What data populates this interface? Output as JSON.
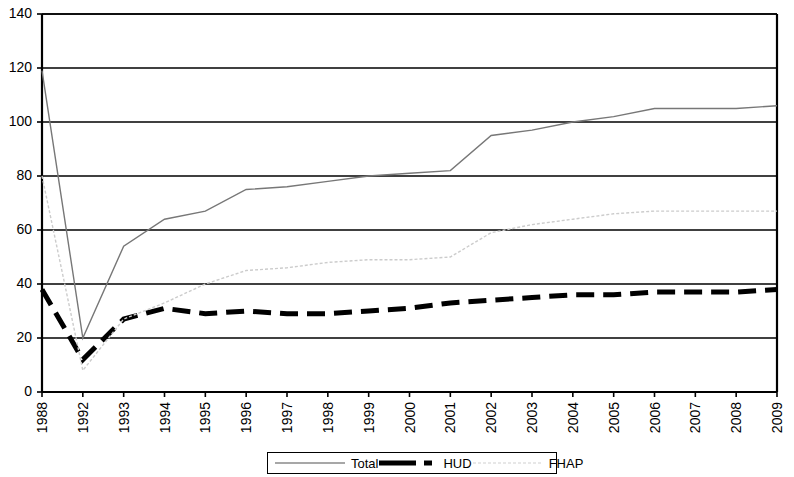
{
  "chart_data": {
    "type": "line",
    "title": "",
    "xlabel": "",
    "ylabel": "",
    "ylim": [
      0,
      140
    ],
    "ytick_step": 20,
    "grid": true,
    "legend_position": "bottom",
    "categories": [
      "1988",
      "1992",
      "1993",
      "1994",
      "1995",
      "1996",
      "1997",
      "1998",
      "1999",
      "2000",
      "2001",
      "2002",
      "2003",
      "2004",
      "2005",
      "2006",
      "2007",
      "2008",
      "2009"
    ],
    "yticks": [
      "0",
      "20",
      "40",
      "60",
      "80",
      "100",
      "120",
      "140"
    ],
    "series": [
      {
        "name": "Total",
        "style": "solid-gray",
        "color": "#777777",
        "values": [
          119,
          20,
          54,
          64,
          67,
          75,
          76,
          78,
          80,
          81,
          82,
          95,
          97,
          100,
          102,
          105,
          105,
          105,
          106
        ]
      },
      {
        "name": "HUD",
        "style": "thick-dashed-black",
        "color": "#000000",
        "values": [
          38,
          12,
          27,
          31,
          29,
          30,
          29,
          29,
          30,
          31,
          33,
          34,
          35,
          36,
          36,
          37,
          37,
          37,
          38
        ]
      },
      {
        "name": "FHAP",
        "style": "dotted-light",
        "color": "#cccccc",
        "values": [
          80,
          8,
          27,
          33,
          40,
          45,
          46,
          48,
          49,
          49,
          50,
          59,
          62,
          64,
          66,
          67,
          67,
          67,
          67
        ]
      }
    ]
  },
  "legend": {
    "items": [
      {
        "label": "Total",
        "swatch": "thin-gray-line"
      },
      {
        "label": "HUD",
        "swatch": "thick-black-dash"
      },
      {
        "label": "FHAP",
        "swatch": "light-dotted-line"
      }
    ]
  }
}
